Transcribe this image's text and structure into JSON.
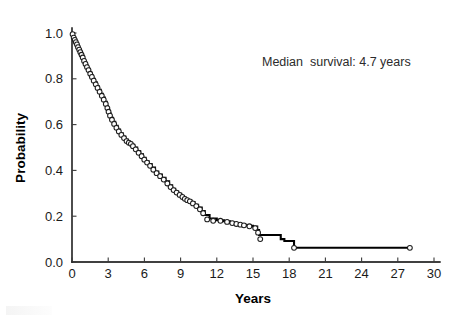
{
  "figure": {
    "background": "#ffffff",
    "curve_color": "#000000",
    "marker_fill": "#ffffff",
    "marker_edge": "#1d1d1d"
  },
  "annotation": {
    "text": "Median  survival: 4.7 years",
    "x_px": 262,
    "y_px": 66
  },
  "axes": {
    "x_title": "Years",
    "y_title": "Probability",
    "x_ticks": [
      "0",
      "3",
      "6",
      "9",
      "12",
      "15",
      "18",
      "21",
      "24",
      "27",
      "30"
    ],
    "y_ticks": [
      "0.0",
      "0.2",
      "0.4",
      "0.6",
      "0.8",
      "1.0"
    ]
  },
  "chart_data": {
    "type": "line",
    "subtype": "kaplan-meier-survival-step",
    "title": "",
    "xlabel": "Years",
    "ylabel": "Probability",
    "xlim": [
      0,
      30
    ],
    "ylim": [
      0.0,
      1.0
    ],
    "xticks": [
      0,
      3,
      6,
      9,
      12,
      15,
      18,
      21,
      24,
      27,
      30
    ],
    "yticks": [
      0.0,
      0.2,
      0.4,
      0.6,
      0.8,
      1.0
    ],
    "grid": false,
    "legend": null,
    "annotations": [
      {
        "text": "Median  survival: 4.7 years",
        "x": 19.3,
        "y": 0.855
      }
    ],
    "series": [
      {
        "name": "Survival probability",
        "drawstyle": "steps-post",
        "x": [
          0.0,
          0.1,
          0.18,
          0.28,
          0.36,
          0.45,
          0.55,
          0.64,
          0.74,
          0.83,
          0.95,
          1.05,
          1.18,
          1.3,
          1.44,
          1.58,
          1.72,
          1.88,
          2.05,
          2.2,
          2.38,
          2.55,
          2.72,
          2.88,
          2.98,
          3.08,
          3.22,
          3.4,
          3.58,
          3.78,
          3.98,
          4.2,
          4.42,
          4.62,
          4.8,
          4.95,
          5.15,
          5.4,
          5.65,
          5.88,
          6.1,
          6.35,
          6.6,
          6.88,
          7.15,
          7.45,
          7.75,
          8.05,
          8.3,
          8.55,
          8.8,
          9.05,
          9.25,
          9.45,
          9.65,
          9.9,
          10.15,
          10.45,
          10.75,
          11.0,
          11.4,
          12.0,
          12.6,
          13.1,
          13.45,
          13.8,
          14.1,
          14.4,
          15.0,
          15.35,
          15.5,
          17.3,
          17.6,
          18.4,
          28.0
        ],
        "y": [
          1.0,
          0.985,
          0.975,
          0.965,
          0.955,
          0.945,
          0.932,
          0.922,
          0.91,
          0.9,
          0.885,
          0.872,
          0.858,
          0.845,
          0.83,
          0.815,
          0.8,
          0.785,
          0.768,
          0.752,
          0.735,
          0.718,
          0.7,
          0.68,
          0.665,
          0.648,
          0.63,
          0.612,
          0.595,
          0.578,
          0.562,
          0.548,
          0.535,
          0.522,
          0.52,
          0.512,
          0.5,
          0.485,
          0.47,
          0.455,
          0.44,
          0.428,
          0.412,
          0.395,
          0.382,
          0.368,
          0.352,
          0.335,
          0.32,
          0.308,
          0.298,
          0.288,
          0.28,
          0.272,
          0.268,
          0.262,
          0.25,
          0.238,
          0.222,
          0.205,
          0.19,
          0.182,
          0.178,
          0.172,
          0.168,
          0.165,
          0.162,
          0.158,
          0.155,
          0.14,
          0.118,
          0.1,
          0.092,
          0.062,
          0.062
        ]
      }
    ],
    "censored_points": [
      {
        "x": 0.05,
        "y": 0.995
      },
      {
        "x": 0.14,
        "y": 0.98
      },
      {
        "x": 0.23,
        "y": 0.97
      },
      {
        "x": 0.32,
        "y": 0.96
      },
      {
        "x": 0.41,
        "y": 0.95
      },
      {
        "x": 0.5,
        "y": 0.938
      },
      {
        "x": 0.6,
        "y": 0.927
      },
      {
        "x": 0.69,
        "y": 0.916
      },
      {
        "x": 0.79,
        "y": 0.905
      },
      {
        "x": 0.89,
        "y": 0.893
      },
      {
        "x": 1.0,
        "y": 0.878
      },
      {
        "x": 1.12,
        "y": 0.865
      },
      {
        "x": 1.24,
        "y": 0.851
      },
      {
        "x": 1.37,
        "y": 0.838
      },
      {
        "x": 1.51,
        "y": 0.822
      },
      {
        "x": 1.65,
        "y": 0.808
      },
      {
        "x": 1.8,
        "y": 0.792
      },
      {
        "x": 1.97,
        "y": 0.776
      },
      {
        "x": 2.12,
        "y": 0.76
      },
      {
        "x": 2.29,
        "y": 0.743
      },
      {
        "x": 2.47,
        "y": 0.726
      },
      {
        "x": 2.63,
        "y": 0.709
      },
      {
        "x": 2.8,
        "y": 0.69
      },
      {
        "x": 2.93,
        "y": 0.672
      },
      {
        "x": 3.03,
        "y": 0.656
      },
      {
        "x": 3.15,
        "y": 0.639
      },
      {
        "x": 3.31,
        "y": 0.621
      },
      {
        "x": 3.49,
        "y": 0.603
      },
      {
        "x": 3.68,
        "y": 0.586
      },
      {
        "x": 3.88,
        "y": 0.57
      },
      {
        "x": 4.09,
        "y": 0.555
      },
      {
        "x": 4.31,
        "y": 0.541
      },
      {
        "x": 4.52,
        "y": 0.528
      },
      {
        "x": 4.71,
        "y": 0.521
      },
      {
        "x": 4.88,
        "y": 0.516
      },
      {
        "x": 5.05,
        "y": 0.506
      },
      {
        "x": 5.28,
        "y": 0.492
      },
      {
        "x": 5.52,
        "y": 0.477
      },
      {
        "x": 5.77,
        "y": 0.462
      },
      {
        "x": 5.99,
        "y": 0.447
      },
      {
        "x": 6.22,
        "y": 0.434
      },
      {
        "x": 6.47,
        "y": 0.42
      },
      {
        "x": 6.74,
        "y": 0.403
      },
      {
        "x": 7.01,
        "y": 0.388
      },
      {
        "x": 7.3,
        "y": 0.375
      },
      {
        "x": 7.6,
        "y": 0.36
      },
      {
        "x": 7.9,
        "y": 0.343
      },
      {
        "x": 8.17,
        "y": 0.327
      },
      {
        "x": 8.42,
        "y": 0.314
      },
      {
        "x": 8.67,
        "y": 0.303
      },
      {
        "x": 8.92,
        "y": 0.293
      },
      {
        "x": 9.15,
        "y": 0.284
      },
      {
        "x": 9.35,
        "y": 0.276
      },
      {
        "x": 9.55,
        "y": 0.27
      },
      {
        "x": 9.77,
        "y": 0.265
      },
      {
        "x": 10.02,
        "y": 0.256
      },
      {
        "x": 10.3,
        "y": 0.244
      },
      {
        "x": 10.6,
        "y": 0.23
      },
      {
        "x": 10.87,
        "y": 0.213
      },
      {
        "x": 11.2,
        "y": 0.186
      },
      {
        "x": 11.7,
        "y": 0.18
      },
      {
        "x": 12.3,
        "y": 0.18
      },
      {
        "x": 12.85,
        "y": 0.175
      },
      {
        "x": 13.28,
        "y": 0.17
      },
      {
        "x": 13.62,
        "y": 0.166
      },
      {
        "x": 13.95,
        "y": 0.163
      },
      {
        "x": 14.25,
        "y": 0.16
      },
      {
        "x": 14.7,
        "y": 0.156
      },
      {
        "x": 15.18,
        "y": 0.148
      },
      {
        "x": 15.42,
        "y": 0.128
      },
      {
        "x": 15.6,
        "y": 0.1
      },
      {
        "x": 18.4,
        "y": 0.062
      },
      {
        "x": 28.0,
        "y": 0.062
      }
    ]
  },
  "geometry": {
    "plot_left_px": 72,
    "plot_right_px": 434,
    "plot_top_px": 33,
    "plot_bottom_px": 262
  }
}
